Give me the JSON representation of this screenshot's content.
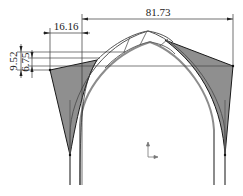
{
  "drawing": {
    "title": "Arch cross-section with dimensions",
    "dimensions": {
      "overall_width": "81.73",
      "offset_width": "16.16",
      "height_outer": "9.52",
      "height_inner": "6.75"
    },
    "colors": {
      "line_dark": "#1a1a1a",
      "line_gray": "#8c8c8c",
      "fill_shade": "#8f8f8f",
      "background": "#ffffff"
    },
    "icons": {
      "origin_axis": "coordinate-axis-icon"
    }
  }
}
